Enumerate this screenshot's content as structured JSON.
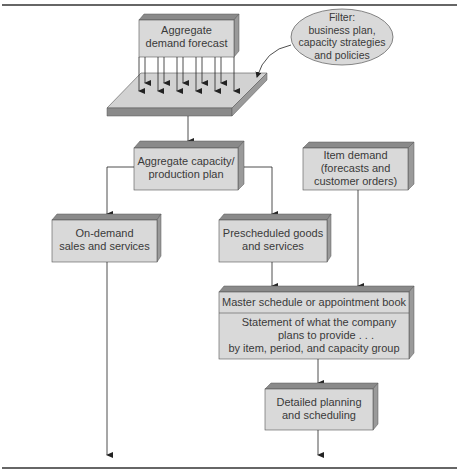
{
  "diagram": {
    "type": "flowchart",
    "nodes": {
      "aggregate_demand": {
        "label_line1": "Aggregate",
        "label_line2": "demand forecast"
      },
      "filter": {
        "line1": "Filter:",
        "line2": "business plan,",
        "line3": "capacity strategies",
        "line4": "and policies"
      },
      "aggregate_capacity": {
        "line1": "Aggregate capacity/",
        "line2": "production plan"
      },
      "item_demand": {
        "line1": "Item demand",
        "line2": "(forecasts and",
        "line3": "customer orders)"
      },
      "on_demand": {
        "line1": "On-demand",
        "line2": "sales and services"
      },
      "prescheduled": {
        "line1": "Prescheduled goods",
        "line2": "and services"
      },
      "master_schedule": {
        "header": "Master schedule or appointment book",
        "line1": "Statement of what the company",
        "line2": "plans to provide . . .",
        "line3": "by item, period, and capacity group"
      },
      "detailed_planning": {
        "line1": "Detailed planning",
        "line2": "and scheduling"
      }
    },
    "edges": [
      [
        "aggregate_demand",
        "filter_platform"
      ],
      [
        "filter",
        "filter_platform"
      ],
      [
        "filter_platform",
        "aggregate_capacity"
      ],
      [
        "aggregate_capacity",
        "on_demand"
      ],
      [
        "aggregate_capacity",
        "prescheduled"
      ],
      [
        "prescheduled",
        "master_schedule"
      ],
      [
        "item_demand",
        "master_schedule"
      ],
      [
        "master_schedule",
        "detailed_planning"
      ],
      [
        "on_demand",
        "output"
      ],
      [
        "detailed_planning",
        "output"
      ]
    ],
    "colors": {
      "box_front": "#d9d9d9",
      "box_top": "#8a8a8a",
      "box_side": "#9a9a9a",
      "line": "#3a3a3a",
      "rule": "#333333"
    }
  }
}
